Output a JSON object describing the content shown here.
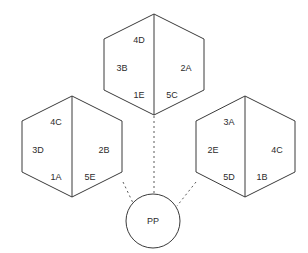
{
  "diagram": {
    "type": "hexagon-cluster-diagram",
    "background_color": "#ffffff",
    "line_color": "#3a3a3a",
    "connector_color": "#5a5a5a",
    "text_color": "#2b2b2b",
    "center_node": {
      "shape": "circle",
      "label": "PP"
    },
    "hexagons": [
      {
        "id": "top",
        "position": "top-center",
        "labels": {
          "top_left": "4D",
          "left": "3B",
          "bottom_left": "1E",
          "bottom_right": "5C",
          "right": "2A"
        }
      },
      {
        "id": "left",
        "position": "middle-left",
        "labels": {
          "top_right": "4C",
          "left": "3D",
          "right": "2B",
          "bottom_left": "1A",
          "bottom_right": "5E"
        }
      },
      {
        "id": "right",
        "position": "middle-right",
        "labels": {
          "top_left": "3A",
          "left": "2E",
          "right": "4C",
          "bottom_left": "5D",
          "bottom_right": "1B"
        }
      }
    ],
    "connectors": [
      {
        "from": "top",
        "to": "center_node",
        "style": "dotted"
      },
      {
        "from": "left",
        "to": "center_node",
        "style": "dotted"
      },
      {
        "from": "right",
        "to": "center_node",
        "style": "dotted"
      }
    ]
  }
}
